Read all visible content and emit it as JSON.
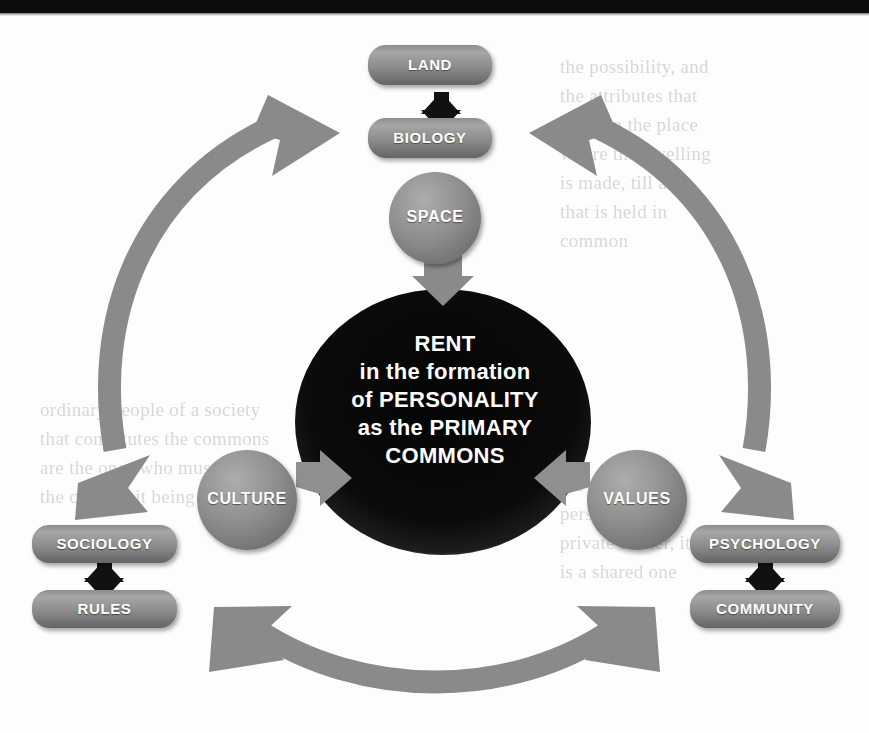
{
  "figure": {
    "title": "RENT in the formation of PERSONALITY as the PRIMARY COMMONS",
    "background_note": "faint bleed-through text from reverse of scanned page"
  },
  "center": {
    "name": "center-ellipse",
    "lines": [
      "RENT",
      "in the formation",
      "of PERSONALITY",
      "as the PRIMARY",
      "COMMONS"
    ],
    "fill": "#0a0a0a",
    "text_color": "#ffffff"
  },
  "nodes": {
    "space": {
      "label": "SPACE",
      "shape": "circle"
    },
    "culture": {
      "label": "CULTURE",
      "shape": "circle"
    },
    "values": {
      "label": "VALUES",
      "shape": "circle"
    },
    "land": {
      "label": "LAND",
      "shape": "rounded-box"
    },
    "biology": {
      "label": "BIOLOGY",
      "shape": "rounded-box"
    },
    "sociology": {
      "label": "SOCIOLOGY",
      "shape": "rounded-box"
    },
    "rules": {
      "label": "RULES",
      "shape": "rounded-box"
    },
    "psychology": {
      "label": "PSYCHOLOGY",
      "shape": "rounded-box"
    },
    "community": {
      "label": "COMMUNITY",
      "shape": "rounded-box"
    }
  },
  "connectors": {
    "land_biology": {
      "kind": "double-arrow-vertical",
      "color": "#111111"
    },
    "sociology_rules": {
      "kind": "double-arrow-vertical",
      "color": "#111111"
    },
    "psychology_community": {
      "kind": "double-arrow-vertical",
      "color": "#111111"
    },
    "space_to_center": {
      "kind": "arrow-down",
      "color": "#7d7d7d"
    },
    "culture_to_center": {
      "kind": "arrow-right",
      "color": "#7d7d7d"
    },
    "values_to_center": {
      "kind": "arrow-left",
      "color": "#7d7d7d"
    },
    "left_curve": {
      "kind": "curved-double-arrow",
      "color": "#8a8a8a"
    },
    "right_curve": {
      "kind": "curved-double-arrow",
      "color": "#8a8a8a"
    },
    "bottom_curve": {
      "kind": "curved-double-arrow",
      "color": "#8a8a8a"
    }
  },
  "colors": {
    "box_fill": "#8a8a8a",
    "box_fill_light": "#a3a3a3",
    "box_fill_dark": "#6a6a6a",
    "circle_fill": "#8f8f8f",
    "arrow_gray": "#8a8a8a",
    "arrow_black": "#111111",
    "center_fill": "#0a0a0a",
    "page_bg": "#fdfdfc",
    "bleed_text": "#b9b9b6"
  },
  "bleed_text": {
    "right": "the possibility, and\nthe attributes that\nsettle in the place\nwhere the dwelling\nis made, till all\nthat is held in\ncommon",
    "middle": "ordinary people of a society\nthat constitutes the commons\nare the ones who must bear\nthe costs of it being lost",
    "low": "the making of a\nperson is not a\nprivate matter, it\nis a shared one"
  }
}
